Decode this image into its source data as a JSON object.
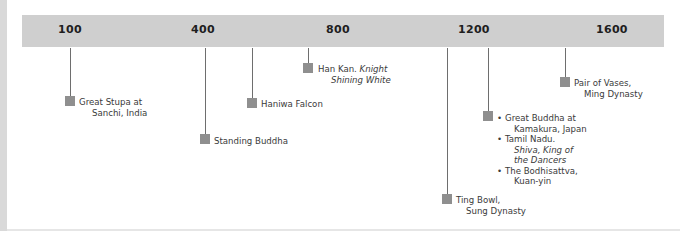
{
  "timeline": {
    "ticks": [
      {
        "label": "100"
      },
      {
        "label": "400"
      },
      {
        "label": "800"
      },
      {
        "label": "1200"
      },
      {
        "label": "1600"
      }
    ],
    "events": [
      {
        "line1": "Great Stupa at",
        "line2": "Sanchi, India"
      },
      {
        "line1": "Standing Buddha"
      },
      {
        "line1": "Haniwa Falcon"
      },
      {
        "line1_plain": "Han Kan. ",
        "line1_italic": "Knight",
        "line2_italic": "Shining White"
      },
      {
        "line1": "Ting Bowl,",
        "line2": "Sung Dynasty"
      },
      {
        "group": [
          {
            "line1": "Great Buddha at",
            "line2": "Kamakura, Japan"
          },
          {
            "line1": "Tamil Nadu.",
            "line2_italic": "Shiva, King of",
            "line3_italic": "the Dancers"
          },
          {
            "line1": "The Bodhisattva,",
            "line2": "Kuan-yin"
          }
        ]
      },
      {
        "line1": "Pair of Vases,",
        "line2": "Ming Dynasty"
      }
    ]
  },
  "colors": {
    "band": "#cfcfcf",
    "marker": "#8f8f8f",
    "stem": "#6e6e6e"
  }
}
